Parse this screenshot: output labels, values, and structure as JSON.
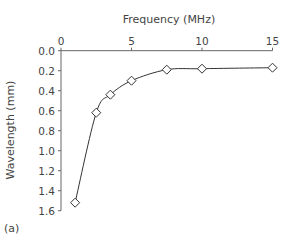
{
  "chart_data": {
    "type": "line",
    "title": "",
    "xlabel": "Frequency (MHz)",
    "ylabel": "Wavelength (mm)",
    "x_axis_position": "top",
    "y_axis_inverted": true,
    "xlim": [
      0,
      15
    ],
    "ylim": [
      0.0,
      1.6
    ],
    "xticks": [
      0,
      5,
      10,
      15
    ],
    "xtick_labels": [
      "0",
      "5",
      "10",
      "15"
    ],
    "yticks": [
      0.0,
      0.2,
      0.4,
      0.6,
      0.8,
      1.0,
      1.2,
      1.4,
      1.6
    ],
    "ytick_labels": [
      "0.0",
      "0.2",
      "0.4",
      "0.6",
      "0.8",
      "1.0",
      "1.2",
      "1.4",
      "1.6"
    ],
    "grid": false,
    "legend": null,
    "marker": "open-diamond",
    "series": [
      {
        "name": "Wavelength",
        "x": [
          1,
          2.5,
          3.5,
          5,
          7.5,
          10,
          15
        ],
        "values": [
          1.52,
          0.62,
          0.44,
          0.3,
          0.19,
          0.18,
          0.17
        ]
      }
    ],
    "panel_label": "(a)"
  },
  "labels": {
    "xlabel": "Frequency (MHz)",
    "ylabel": "Wavelength (mm)",
    "panel": "(a)"
  }
}
